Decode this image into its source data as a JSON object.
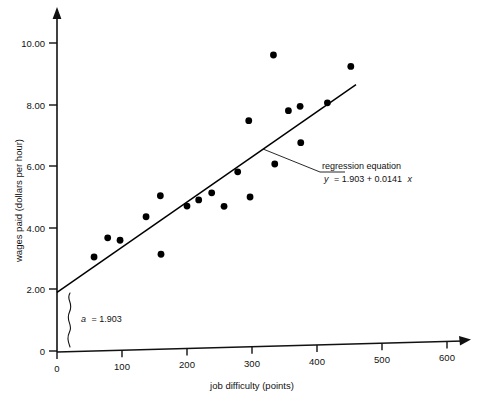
{
  "chart_data": {
    "type": "scatter",
    "title": "",
    "xlabel": "job difficulty (points)",
    "ylabel": "wages paid (dollars per hour)",
    "xlim": [
      0,
      600
    ],
    "ylim": [
      0,
      10.8
    ],
    "grid": false,
    "legend": "none",
    "xticks": [
      "0",
      "100",
      "200",
      "300",
      "400",
      "500",
      "600"
    ],
    "xtick_values": [
      0,
      100,
      200,
      300,
      400,
      500,
      600
    ],
    "yticks": [
      "0",
      "2.00",
      "4.00",
      "6.00",
      "8.00",
      "10.00"
    ],
    "ytick_values": [
      0,
      2,
      4,
      6,
      8,
      10
    ],
    "series": [
      {
        "name": "observations",
        "marker": "filled-circle",
        "color": "#000000",
        "points": [
          {
            "x": 57,
            "y": 3.02
          },
          {
            "x": 78,
            "y": 3.63
          },
          {
            "x": 97,
            "y": 3.54
          },
          {
            "x": 137,
            "y": 4.28
          },
          {
            "x": 159,
            "y": 4.95
          },
          {
            "x": 160,
            "y": 3.05
          },
          {
            "x": 200,
            "y": 4.59
          },
          {
            "x": 218,
            "y": 4.78
          },
          {
            "x": 238,
            "y": 5.0
          },
          {
            "x": 257,
            "y": 4.55
          },
          {
            "x": 278,
            "y": 5.66
          },
          {
            "x": 295,
            "y": 7.31
          },
          {
            "x": 297,
            "y": 4.83
          },
          {
            "x": 333,
            "y": 9.42
          },
          {
            "x": 335,
            "y": 5.88
          },
          {
            "x": 356,
            "y": 7.6
          },
          {
            "x": 374,
            "y": 7.73
          },
          {
            "x": 375,
            "y": 6.55
          },
          {
            "x": 416,
            "y": 7.82
          },
          {
            "x": 452,
            "y": 8.98
          }
        ]
      }
    ],
    "regression": {
      "intercept": 1.903,
      "slope": 0.0141,
      "x_start": 0,
      "x_end": 460,
      "color": "#000000"
    },
    "annotations": {
      "regression_label_line1": "regression equation",
      "regression_label_line2_lhs": "y",
      "regression_label_line2_rhs": "= 1.903 + 0.0141",
      "regression_label_line2_var": "x",
      "intercept_label_var": "a",
      "intercept_label_value": "= 1.903"
    }
  },
  "axes": {
    "x_axis_name": "job difficulty axis",
    "y_axis_name": "wages paid axis"
  }
}
